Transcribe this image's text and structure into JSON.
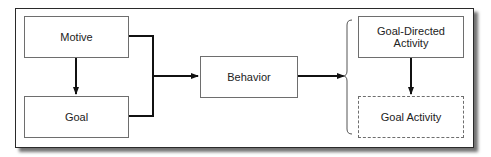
{
  "diagram": {
    "type": "flowchart",
    "nodes": {
      "motive": {
        "label": "Motive",
        "style": "solid"
      },
      "goal": {
        "label": "Goal",
        "style": "solid"
      },
      "behavior": {
        "label": "Behavior",
        "style": "solid"
      },
      "goal_directed_activity": {
        "label": "Goal-Directed Activity",
        "style": "solid"
      },
      "goal_activity": {
        "label": "Goal Activity",
        "style": "dashed"
      }
    },
    "edges": [
      {
        "from": "Motive",
        "to": "Goal",
        "kind": "arrow"
      },
      {
        "from": "Motive + Goal",
        "to": "Behavior",
        "kind": "bracket-arrow"
      },
      {
        "from": "Behavior",
        "to": "Goal-Directed Activity / Goal Activity",
        "kind": "arrow-to-brace"
      },
      {
        "from": "Goal-Directed Activity",
        "to": "Goal Activity",
        "kind": "arrow"
      }
    ],
    "colors": {
      "line": "#111111",
      "box_border": "#6e6e6e",
      "text": "#222222",
      "background": "#ffffff"
    }
  }
}
